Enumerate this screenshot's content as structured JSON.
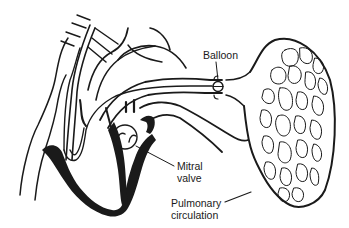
{
  "diagram": {
    "labels": {
      "balloon": "Balloon",
      "mitral_line1": "Mitral",
      "mitral_line2": "valve",
      "pulmonary_line1": "Pulmonary",
      "pulmonary_line2": "circulation"
    },
    "colors": {
      "ink": "#1a1a1a",
      "background": "#ffffff"
    }
  }
}
